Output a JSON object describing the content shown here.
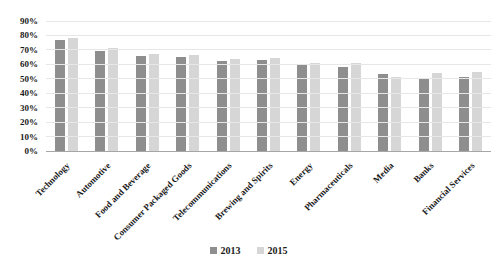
{
  "chart_data": {
    "type": "bar",
    "title": "",
    "xlabel": "",
    "ylabel": "",
    "ylim": [
      0,
      90
    ],
    "y_tick_step": 10,
    "y_tick_labels": [
      "0%",
      "10%",
      "20%",
      "30%",
      "40%",
      "50%",
      "60%",
      "70%",
      "80%",
      "90%"
    ],
    "grid": true,
    "legend_position": "bottom",
    "categories": [
      "Technology",
      "Automotive",
      "Food and Beverage",
      "Consumer Packaged Goods",
      "Telecommunications",
      "Brewing and Spirits",
      "Energy",
      "Pharmaceuticals",
      "Media",
      "Banks",
      "Financial Services"
    ],
    "series": [
      {
        "name": "2013",
        "color": "#8e8e8e",
        "values": [
          77,
          69,
          66,
          65,
          62.5,
          63,
          59.5,
          58,
          53.5,
          50.5,
          51
        ]
      },
      {
        "name": "2015",
        "color": "#d6d6d6",
        "values": [
          78,
          71,
          67,
          66.5,
          63.5,
          64.5,
          61,
          61,
          51,
          54,
          55
        ]
      }
    ]
  },
  "colors": {
    "background": "#ffffff",
    "gridline": "#e7e7e7",
    "axis_line": "#a6a6a6",
    "text": "#1a1a1a"
  }
}
